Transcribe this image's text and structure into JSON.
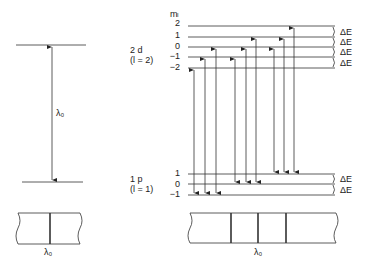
{
  "left": {
    "lambda_label": "λ₀",
    "spectrum_label": "λ₀"
  },
  "right": {
    "ml_header": "mₗ",
    "upper_state": {
      "name": "2 d",
      "quantum": "(l = 2)",
      "ml": [
        "2",
        "1",
        "0",
        "−1",
        "−2"
      ]
    },
    "lower_state": {
      "name": "1 p",
      "quantum": "(l = 1)",
      "ml": [
        "1",
        "0",
        "−1"
      ]
    },
    "spacing_label": "ΔE",
    "spectrum_label": "λ₀"
  }
}
